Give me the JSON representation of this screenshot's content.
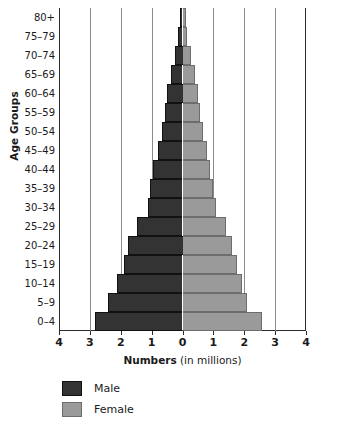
{
  "chart_data": {
    "type": "bar",
    "subtype": "population-pyramid",
    "title": "",
    "xlabel_bold": "Numbers",
    "xlabel_plain": " (in millions)",
    "ylabel": "Age Groups",
    "grid": true,
    "legend_position": "bottom-left",
    "xlim": [
      -4,
      4
    ],
    "x_unit": "millions",
    "xticks": [
      4,
      3,
      2,
      1,
      0,
      1,
      2,
      3,
      4
    ],
    "xtick_values": [
      -4,
      -3,
      -2,
      -1,
      0,
      1,
      2,
      3,
      4
    ],
    "categories": [
      "80+",
      "75–79",
      "70–74",
      "65–69",
      "60–64",
      "55–59",
      "50–54",
      "45–49",
      "40–44",
      "35–39",
      "30–34",
      "25–29",
      "20–24",
      "15–19",
      "10–14",
      "5–9",
      "0–4"
    ],
    "series": [
      {
        "name": "Male",
        "color": "#333333",
        "side": "left",
        "values": [
          0.08,
          0.14,
          0.25,
          0.38,
          0.5,
          0.56,
          0.65,
          0.8,
          0.95,
          1.05,
          1.12,
          1.47,
          1.75,
          1.9,
          2.12,
          2.42,
          2.82
        ]
      },
      {
        "name": "Female",
        "color": "#9a9a9a",
        "side": "right",
        "values": [
          0.1,
          0.16,
          0.28,
          0.4,
          0.5,
          0.56,
          0.65,
          0.78,
          0.9,
          1.0,
          1.1,
          1.4,
          1.6,
          1.75,
          1.93,
          2.08,
          2.56
        ]
      }
    ]
  },
  "legend": {
    "items": [
      {
        "label": "Male",
        "color": "#333333"
      },
      {
        "label": "Female",
        "color": "#9a9a9a"
      }
    ]
  }
}
